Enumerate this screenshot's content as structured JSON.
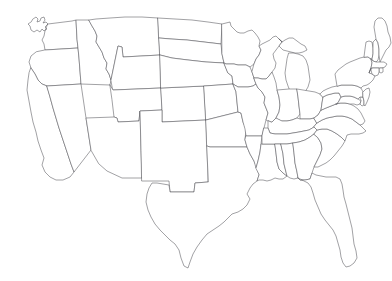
{
  "document": {
    "type": "map",
    "title": "United States Outline Map",
    "subtitle": "Blank map of the contiguous 48 states",
    "caption": "",
    "width": 392,
    "height": 281
  },
  "style": {
    "background_color": "#ffffff",
    "border_color": "#55555a",
    "fill_color": "#ffffff",
    "stroke_width": 0.55,
    "labels_visible": false
  },
  "map": {
    "region": "Contiguous United States",
    "projection": "Albers Equal Area (conic)",
    "state_count": 48,
    "includes_alaska": false,
    "includes_hawaii": false,
    "shows_state_borders": true,
    "shows_labels": false,
    "shows_water": false,
    "shows_great_lakes_outline": true
  },
  "states": [
    {
      "code": "WA",
      "name": "Washington"
    },
    {
      "code": "OR",
      "name": "Oregon"
    },
    {
      "code": "CA",
      "name": "California"
    },
    {
      "code": "ID",
      "name": "Idaho"
    },
    {
      "code": "NV",
      "name": "Nevada"
    },
    {
      "code": "MT",
      "name": "Montana"
    },
    {
      "code": "WY",
      "name": "Wyoming"
    },
    {
      "code": "UT",
      "name": "Utah"
    },
    {
      "code": "AZ",
      "name": "Arizona"
    },
    {
      "code": "CO",
      "name": "Colorado"
    },
    {
      "code": "NM",
      "name": "New Mexico"
    },
    {
      "code": "ND",
      "name": "North Dakota"
    },
    {
      "code": "SD",
      "name": "South Dakota"
    },
    {
      "code": "NE",
      "name": "Nebraska"
    },
    {
      "code": "KS",
      "name": "Kansas"
    },
    {
      "code": "OK",
      "name": "Oklahoma"
    },
    {
      "code": "TX",
      "name": "Texas"
    },
    {
      "code": "MN",
      "name": "Minnesota"
    },
    {
      "code": "IA",
      "name": "Iowa"
    },
    {
      "code": "MO",
      "name": "Missouri"
    },
    {
      "code": "AR",
      "name": "Arkansas"
    },
    {
      "code": "LA",
      "name": "Louisiana"
    },
    {
      "code": "WI",
      "name": "Wisconsin"
    },
    {
      "code": "IL",
      "name": "Illinois"
    },
    {
      "code": "MI",
      "name": "Michigan"
    },
    {
      "code": "IN",
      "name": "Indiana"
    },
    {
      "code": "OH",
      "name": "Ohio"
    },
    {
      "code": "KY",
      "name": "Kentucky"
    },
    {
      "code": "TN",
      "name": "Tennessee"
    },
    {
      "code": "MS",
      "name": "Mississippi"
    },
    {
      "code": "AL",
      "name": "Alabama"
    },
    {
      "code": "GA",
      "name": "Georgia"
    },
    {
      "code": "FL",
      "name": "Florida"
    },
    {
      "code": "SC",
      "name": "South Carolina"
    },
    {
      "code": "NC",
      "name": "North Carolina"
    },
    {
      "code": "VA",
      "name": "Virginia"
    },
    {
      "code": "WV",
      "name": "West Virginia"
    },
    {
      "code": "MD",
      "name": "Maryland"
    },
    {
      "code": "DE",
      "name": "Delaware"
    },
    {
      "code": "PA",
      "name": "Pennsylvania"
    },
    {
      "code": "NJ",
      "name": "New Jersey"
    },
    {
      "code": "NY",
      "name": "New York"
    },
    {
      "code": "CT",
      "name": "Connecticut"
    },
    {
      "code": "RI",
      "name": "Rhode Island"
    },
    {
      "code": "MA",
      "name": "Massachusetts"
    },
    {
      "code": "VT",
      "name": "Vermont"
    },
    {
      "code": "NH",
      "name": "New Hampshire"
    },
    {
      "code": "ME",
      "name": "Maine"
    }
  ]
}
